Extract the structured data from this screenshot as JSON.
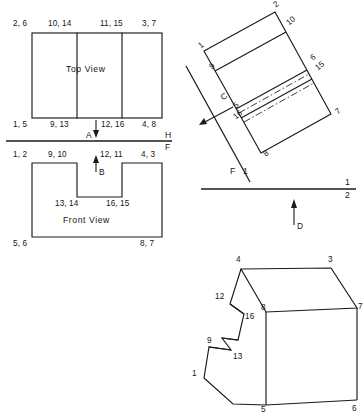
{
  "figure": {
    "kind": "orthographic-projection-drawing",
    "background": "#ffffff",
    "line_color": "#1a1a1a",
    "views": [
      "Top View",
      "Front View",
      "Auxiliary View",
      "Isometric View"
    ]
  },
  "top_view": {
    "title": "Top  View",
    "labels_top": [
      "2, 6",
      "10, 14",
      "11, 15",
      "3, 7"
    ],
    "labels_bottom": [
      "1, 5",
      "9, 13",
      "12, 16",
      "4, 8"
    ],
    "arrow_label": "A"
  },
  "fold_line_hf": {
    "upper": "H",
    "lower": "F"
  },
  "front_view": {
    "title": "Front  View",
    "labels_top": [
      "1, 2",
      "9, 10",
      "12, 11",
      "4, 3"
    ],
    "labels_notch": [
      "13, 14",
      "16, 15"
    ],
    "labels_bottom": [
      "5, 6",
      "8, 7"
    ],
    "arrow_label": "B"
  },
  "auxiliary_view": {
    "arrow_label": "C",
    "vertex_labels": [
      "2",
      "10",
      "1",
      "9",
      "6",
      "15",
      "5",
      "16",
      "7",
      "8"
    ]
  },
  "fold_line_f1": {
    "upper": "F",
    "lower": "1"
  },
  "reference_line_12": {
    "upper": "1",
    "lower": "2",
    "arrow_label": "D"
  },
  "isometric_view": {
    "vertex_labels": [
      "4",
      "3",
      "12",
      "8",
      "7",
      "16",
      "9",
      "13",
      "1",
      "5",
      "6"
    ]
  }
}
